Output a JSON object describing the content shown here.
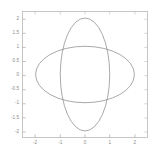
{
  "figure": {
    "title": "",
    "background_color": "#ffffff",
    "frame_color": "#b9b9b9",
    "curve_color": "#8c8c8c",
    "tick_label_color": "#8a8a8a"
  },
  "chart_data": {
    "type": "line",
    "title": "",
    "xlabel": "",
    "ylabel": "",
    "xlim": [
      -2.55,
      2.55
    ],
    "ylim": [
      -2.25,
      2.25
    ],
    "grid": false,
    "legend": null,
    "xticks": [
      -2,
      -1,
      0,
      1,
      2
    ],
    "xticklabels": [
      "-2",
      "-1",
      "0",
      "1",
      "2"
    ],
    "yticks": [
      -2,
      -1.5,
      -1,
      -0.5,
      0,
      0.5,
      1,
      1.5,
      2
    ],
    "yticklabels": [
      "-2",
      "-1.5",
      "-1",
      "-0.5",
      "0",
      "0.5",
      "1",
      "1.5",
      "2"
    ],
    "series": [
      {
        "name": "horizontal-ellipse",
        "shape": "ellipse",
        "center": [
          0,
          0
        ],
        "semi_axis_x": 2,
        "semi_axis_y": 1,
        "equation": "x^2/4 + y^2/1 = 1",
        "color": "#8c8c8c"
      },
      {
        "name": "vertical-ellipse",
        "shape": "ellipse",
        "center": [
          0,
          0
        ],
        "semi_axis_x": 1,
        "semi_axis_y": 2,
        "equation": "x^2/1 + y^2/4 = 1",
        "color": "#8c8c8c"
      }
    ],
    "intersections": [
      [
        -0.894,
        0.894
      ],
      [
        0.894,
        0.894
      ],
      [
        -0.894,
        -0.894
      ],
      [
        0.894,
        -0.894
      ]
    ]
  },
  "plot_area": {
    "left_px": 22,
    "top_px": 11,
    "right_px": 148,
    "bottom_px": 138
  }
}
